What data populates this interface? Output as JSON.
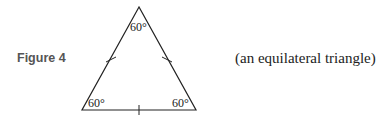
{
  "figure": {
    "label": "Figure 4",
    "caption": "(an equilateral triangle)",
    "angles": {
      "top": "60°",
      "bottom_left": "60°",
      "bottom_right": "60°"
    },
    "vertices": {
      "top": [
        139,
        7
      ],
      "bottom_left": [
        82,
        110
      ],
      "bottom_right": [
        196,
        110
      ]
    },
    "tick_marks": 3,
    "line_color": "#222222"
  }
}
